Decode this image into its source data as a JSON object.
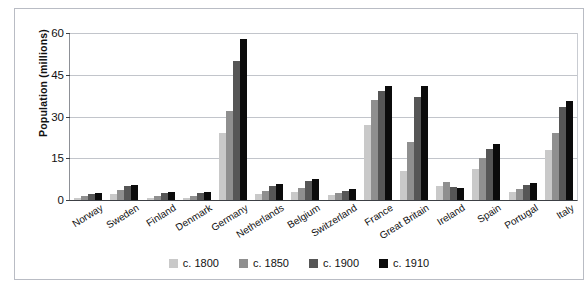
{
  "chart_data": {
    "type": "bar",
    "title": "",
    "xlabel": "",
    "ylabel": "Population  (millions)",
    "ylim": [
      0,
      60
    ],
    "yticks": [
      0,
      15,
      30,
      45,
      60
    ],
    "grid": true,
    "legend_position": "bottom",
    "categories": [
      "Norway",
      "Sweden",
      "Finland",
      "Denmark",
      "Germany",
      "Netherlands",
      "Belgium",
      "Switzerland",
      "France",
      "Great Britain",
      "Ireland",
      "Spain",
      "Portugal",
      "Italy"
    ],
    "series": [
      {
        "name": "c. 1800",
        "color": "#c9c9c9",
        "values": [
          0.9,
          2.3,
          0.8,
          0.9,
          24.0,
          2.1,
          3.0,
          1.7,
          27.0,
          10.5,
          5.0,
          11.0,
          3.0,
          18.0
        ]
      },
      {
        "name": "c. 1850",
        "color": "#8f8f8f",
        "values": [
          1.4,
          3.5,
          1.6,
          1.4,
          32.0,
          3.1,
          4.3,
          2.4,
          36.0,
          21.0,
          6.5,
          15.0,
          4.0,
          24.0
        ]
      },
      {
        "name": "c. 1900",
        "color": "#565656",
        "values": [
          2.2,
          5.1,
          2.7,
          2.4,
          50.0,
          5.1,
          6.7,
          3.3,
          39.0,
          37.0,
          4.5,
          18.5,
          5.5,
          33.5
        ]
      },
      {
        "name": "c. 1910",
        "color": "#0b0b0b",
        "values": [
          2.4,
          5.5,
          3.0,
          2.8,
          58.0,
          5.9,
          7.4,
          3.8,
          41.0,
          41.0,
          4.3,
          20.0,
          6.0,
          35.5
        ]
      }
    ]
  }
}
